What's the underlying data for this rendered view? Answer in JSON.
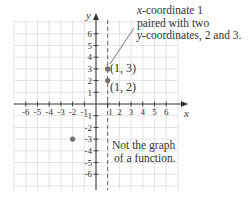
{
  "diagram": {
    "type": "coordinate-plane",
    "x_axis": {
      "label": "x",
      "range": [
        -6,
        6
      ],
      "ticks": [
        "-6",
        "-5",
        "-4",
        "-3",
        "-2",
        "-1",
        "1",
        "2",
        "3",
        "4",
        "5",
        "6"
      ]
    },
    "y_axis": {
      "label": "y",
      "range": [
        -6,
        6
      ],
      "ticks": [
        "6",
        "5",
        "4",
        "3",
        "2",
        "1",
        "-1",
        "-2",
        "-3",
        "-4",
        "-5",
        "-6"
      ]
    },
    "points": [
      {
        "x": 1,
        "y": 3,
        "label": "(1, 3)"
      },
      {
        "x": 1,
        "y": 2,
        "label": "(1, 2)"
      },
      {
        "x": -2,
        "y": -3,
        "label": ""
      }
    ],
    "vertical_line": {
      "x": 1,
      "style": "dashed"
    },
    "annotations": {
      "top_line1": "x-coordinate 1",
      "top_line2": "paired with two",
      "top_line3": "y-coordinates, 2 and 3.",
      "bottom_line1": "Not the graph",
      "bottom_line2": "of a function."
    },
    "colors": {
      "grid": "#d9d9d9",
      "axis": "#333333",
      "point": "#707070",
      "dashed": "#555555"
    }
  }
}
